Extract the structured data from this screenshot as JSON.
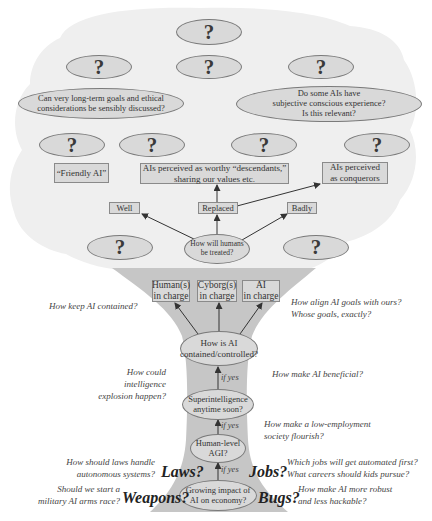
{
  "canopy": {
    "top_question": "?",
    "row2_questions": [
      "?",
      "?",
      "?"
    ],
    "long_term_goals": "Can very long-term goals and ethical considerations be sensibly discussed?",
    "conscious_experience": [
      "Do some AIs have",
      "subjective conscious experience?",
      "Is this relevant?"
    ],
    "row3_questions": [
      "?",
      "?",
      "?",
      "?"
    ],
    "friendly_ai": "“Friendly AI”",
    "descendants": [
      "AIs perceived  as  worthy “descendants,”",
      "sharing our values etc."
    ],
    "conquerors": [
      "AIs perceived",
      "as conquerors"
    ],
    "outcomes": {
      "well": "Well",
      "replaced": "Replaced",
      "badly": "Badly"
    },
    "humans_treated": [
      "How will humans",
      "be treated?"
    ],
    "side_questions": [
      "?",
      "?"
    ]
  },
  "trunk": {
    "control_options": [
      {
        "line1": "Human(s)",
        "line2": "in charge"
      },
      {
        "line1": "Cyborg(s)",
        "line2": "in charge"
      },
      {
        "line1": "AI",
        "line2": "in charge"
      }
    ],
    "contained": [
      "How is AI",
      "contained/controlled?"
    ],
    "superintelligence": [
      "Superintelligence",
      "anytime soon?"
    ],
    "agi": [
      "Human-level",
      "AGI?"
    ],
    "growing_impact": [
      "Growing impact of",
      "AI on economy?"
    ],
    "if_yes": "if yes"
  },
  "annotations": {
    "keep_contained": "How keep AI contained?",
    "align_goals": [
      "How align AI goals with ours?",
      "Whose goals, exactly?"
    ],
    "intelligence_explosion": [
      "How could intelligence",
      "explosion happen?"
    ],
    "beneficial": "How make AI beneficial?",
    "low_employment": [
      "How make a low-employment",
      "society flourish?"
    ],
    "laws_q": [
      "How should laws handle",
      "autonomous systems?"
    ],
    "jobs_q": [
      "Which jobs will get automated first?",
      "What careers should kids pursue?"
    ],
    "weapons_q": [
      "Should we start a",
      "military AI arms race?"
    ],
    "bugs_q": [
      "How make AI more robust",
      "and less hackable?"
    ]
  },
  "big_labels": {
    "laws": "Laws?",
    "jobs": "Jobs?",
    "weapons": "Weapons?",
    "bugs": "Bugs?"
  },
  "colors": {
    "canopy": "#efefef",
    "trunk": "#c6c6c6",
    "node_fill": "#d9d9d9",
    "node_border": "#7a7a7a",
    "arrow": "#333333"
  }
}
